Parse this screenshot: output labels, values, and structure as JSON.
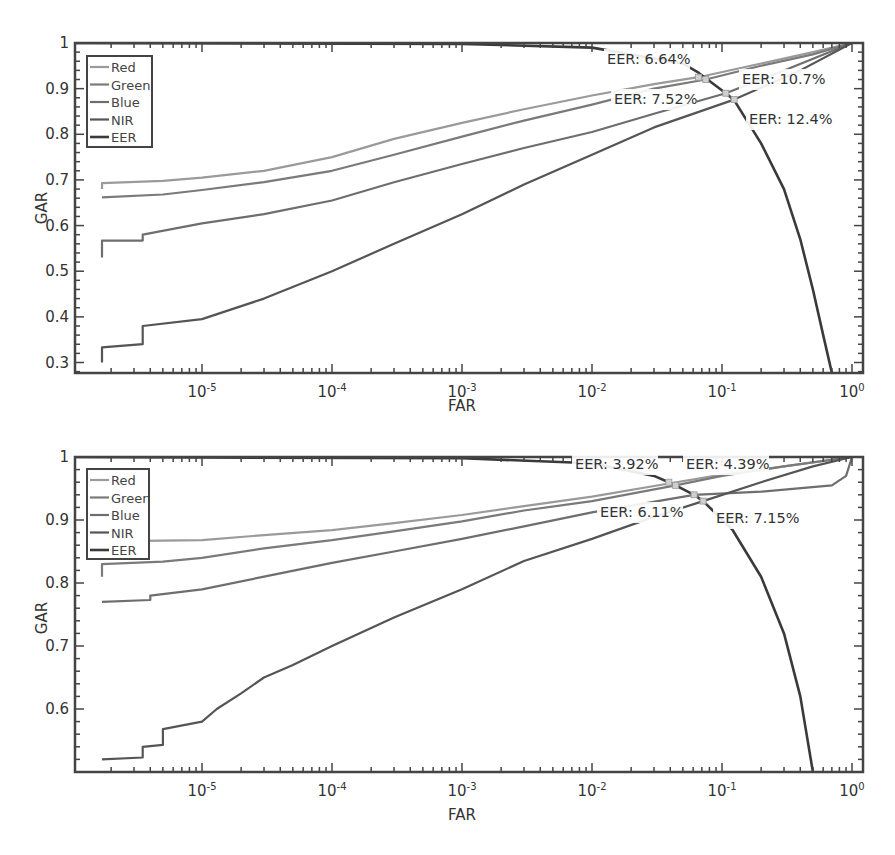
{
  "chart_data": [
    {
      "type": "line",
      "panel": "top",
      "title": "",
      "xlabel": "FAR",
      "ylabel": "GAR",
      "xscale": "log",
      "xlim": [
        1e-06,
        1
      ],
      "ylim": [
        0.277,
        1
      ],
      "xticks": [
        "10-5",
        "10-4",
        "10-3",
        "10-2",
        "10-1",
        "100"
      ],
      "xtick_values": [
        1e-05,
        0.0001,
        0.001,
        0.01,
        0.1,
        1
      ],
      "yticks": [
        0.3,
        0.4,
        0.5,
        0.6,
        0.7,
        0.8,
        0.9,
        1
      ],
      "ytick_labels": [
        "0.3",
        "0.4",
        "0.5",
        "0.6",
        "0.7",
        "0.8",
        "0.9",
        "1"
      ],
      "grid": false,
      "legend_position": "upper left",
      "legend": [
        "Red",
        "Green",
        "Blue",
        "NIR",
        "EER"
      ],
      "series": [
        {
          "name": "Red",
          "color": "#9a9a9a",
          "width": 2.2,
          "x": [
            1.7e-06,
            1.7e-06,
            5e-06,
            1e-05,
            3e-05,
            0.0001,
            0.0003,
            0.001,
            0.003,
            0.01,
            0.03,
            0.066,
            0.2,
            0.5,
            1
          ],
          "y": [
            0.68,
            0.693,
            0.698,
            0.705,
            0.72,
            0.75,
            0.79,
            0.825,
            0.855,
            0.885,
            0.91,
            0.925,
            0.955,
            0.98,
            1
          ]
        },
        {
          "name": "Green",
          "color": "#7a7a7a",
          "width": 2.2,
          "x": [
            1.7e-06,
            5e-06,
            1e-05,
            3e-05,
            0.0001,
            0.0003,
            0.001,
            0.003,
            0.01,
            0.03,
            0.075,
            0.2,
            0.5,
            1
          ],
          "y": [
            0.662,
            0.668,
            0.678,
            0.695,
            0.72,
            0.755,
            0.795,
            0.83,
            0.865,
            0.9,
            0.92,
            0.95,
            0.975,
            1
          ]
        },
        {
          "name": "Blue",
          "color": "#6e6e6e",
          "width": 2.2,
          "x": [
            1.7e-06,
            1.7e-06,
            3.5e-06,
            3.5e-06,
            1e-05,
            3e-05,
            0.0001,
            0.0003,
            0.001,
            0.003,
            0.01,
            0.03,
            0.107,
            0.3,
            1
          ],
          "y": [
            0.53,
            0.567,
            0.567,
            0.58,
            0.605,
            0.625,
            0.655,
            0.695,
            0.735,
            0.77,
            0.805,
            0.845,
            0.89,
            0.94,
            1
          ]
        },
        {
          "name": "NIR",
          "color": "#555555",
          "width": 2.2,
          "x": [
            1.7e-06,
            1.7e-06,
            3.5e-06,
            3.5e-06,
            1e-05,
            3e-05,
            0.0001,
            0.0003,
            0.001,
            0.003,
            0.01,
            0.03,
            0.124,
            0.4,
            1
          ],
          "y": [
            0.3,
            0.333,
            0.34,
            0.38,
            0.395,
            0.44,
            0.5,
            0.56,
            0.625,
            0.69,
            0.755,
            0.815,
            0.876,
            0.94,
            1
          ]
        },
        {
          "name": "EER",
          "color": "#3a3a3a",
          "width": 2.6,
          "x": [
            1e-06,
            0.001,
            0.01,
            0.05,
            0.066,
            0.107,
            0.124,
            0.2,
            0.3,
            0.4,
            0.5,
            0.6,
            0.7
          ],
          "y": [
            1.0,
            0.998,
            0.99,
            0.955,
            0.935,
            0.89,
            0.875,
            0.78,
            0.68,
            0.57,
            0.46,
            0.36,
            0.277
          ]
        }
      ],
      "annotations": [
        {
          "text": "EER: 6.64%",
          "x": 0.066,
          "y": 0.925,
          "label_px": [
            607,
            64
          ]
        },
        {
          "text": "EER: 7.52%",
          "x": 0.075,
          "y": 0.92,
          "label_px": [
            614,
            104
          ]
        },
        {
          "text": "EER: 10.7%",
          "x": 0.107,
          "y": 0.89,
          "label_px": [
            742,
            84
          ]
        },
        {
          "text": "EER: 12.4%",
          "x": 0.124,
          "y": 0.876,
          "label_px": [
            749,
            124
          ]
        }
      ]
    },
    {
      "type": "line",
      "panel": "bottom",
      "title": "",
      "xlabel": "FAR",
      "ylabel": "GAR",
      "xscale": "log",
      "xlim": [
        1e-06,
        1
      ],
      "ylim": [
        0.5,
        1
      ],
      "xticks": [
        "10-5",
        "10-4",
        "10-3",
        "10-2",
        "10-1",
        "100"
      ],
      "xtick_values": [
        1e-05,
        0.0001,
        0.001,
        0.01,
        0.1,
        1
      ],
      "yticks": [
        0.6,
        0.7,
        0.8,
        0.9,
        1
      ],
      "ytick_labels": [
        "0.6",
        "0.7",
        "0.8",
        "0.9",
        "1"
      ],
      "grid": false,
      "legend_position": "upper left",
      "legend": [
        "Red",
        "Green",
        "Blue",
        "NIR",
        "EER"
      ],
      "series": [
        {
          "name": "Red",
          "color": "#9a9a9a",
          "width": 2.2,
          "x": [
            1.7e-06,
            1e-05,
            3e-05,
            0.0001,
            0.0003,
            0.001,
            0.003,
            0.01,
            0.039,
            0.1,
            0.3,
            1
          ],
          "y": [
            0.866,
            0.868,
            0.876,
            0.884,
            0.895,
            0.908,
            0.922,
            0.937,
            0.958,
            0.972,
            0.985,
            1
          ]
        },
        {
          "name": "Green",
          "color": "#7a7a7a",
          "width": 2.2,
          "x": [
            1.7e-06,
            1.7e-06,
            5e-06,
            1e-05,
            3e-05,
            0.0001,
            0.0003,
            0.001,
            0.003,
            0.01,
            0.044,
            0.1,
            0.3,
            1
          ],
          "y": [
            0.81,
            0.83,
            0.834,
            0.84,
            0.855,
            0.868,
            0.882,
            0.898,
            0.915,
            0.93,
            0.955,
            0.97,
            0.985,
            1
          ]
        },
        {
          "name": "Blue",
          "color": "#6e6e6e",
          "width": 2.2,
          "x": [
            1.7e-06,
            4e-06,
            4e-06,
            1e-05,
            3e-05,
            0.0001,
            0.0003,
            0.001,
            0.003,
            0.01,
            0.061,
            0.2,
            0.7,
            0.9,
            1
          ],
          "y": [
            0.77,
            0.773,
            0.78,
            0.79,
            0.81,
            0.832,
            0.85,
            0.87,
            0.89,
            0.912,
            0.94,
            0.945,
            0.955,
            0.97,
            1
          ]
        },
        {
          "name": "NIR",
          "color": "#555555",
          "width": 2.2,
          "x": [
            1.7e-06,
            3.5e-06,
            3.5e-06,
            5e-06,
            5e-06,
            1e-05,
            1.3e-05,
            2e-05,
            3e-05,
            5e-05,
            0.0001,
            0.0003,
            0.001,
            0.003,
            0.01,
            0.03,
            0.0715,
            0.2,
            0.5,
            1
          ],
          "y": [
            0.52,
            0.523,
            0.54,
            0.543,
            0.568,
            0.58,
            0.6,
            0.625,
            0.65,
            0.67,
            0.7,
            0.745,
            0.79,
            0.835,
            0.87,
            0.905,
            0.93,
            0.96,
            0.985,
            1
          ]
        },
        {
          "name": "EER",
          "color": "#3a3a3a",
          "width": 2.6,
          "x": [
            1e-06,
            0.001,
            0.01,
            0.03,
            0.039,
            0.044,
            0.061,
            0.0715,
            0.12,
            0.2,
            0.3,
            0.4,
            0.5
          ],
          "y": [
            1.0,
            0.998,
            0.99,
            0.97,
            0.96,
            0.955,
            0.94,
            0.93,
            0.885,
            0.81,
            0.72,
            0.62,
            0.5
          ]
        }
      ],
      "annotations": [
        {
          "text": "EER: 3.92%",
          "x": 0.039,
          "y": 0.96,
          "label_px": [
            575,
            469
          ]
        },
        {
          "text": "EER: 4.39%",
          "x": 0.044,
          "y": 0.955,
          "label_px": [
            686,
            469
          ]
        },
        {
          "text": "EER: 6.11%",
          "x": 0.061,
          "y": 0.94,
          "label_px": [
            600,
            517
          ]
        },
        {
          "text": "EER: 7.15%",
          "x": 0.0715,
          "y": 0.93,
          "label_px": [
            716,
            523
          ]
        }
      ]
    }
  ],
  "panels": [
    {
      "name": "top",
      "left": 75,
      "top": 43,
      "right": 863,
      "bottom": 373,
      "x_decade_px": 130,
      "x_at_1": 852,
      "ylabel_px": [
        47,
        208
      ],
      "xlabel_px": [
        462,
        411
      ]
    },
    {
      "name": "bottom",
      "left": 75,
      "top": 457,
      "right": 863,
      "bottom": 772,
      "x_decade_px": 130,
      "x_at_1": 852,
      "ylabel_px": [
        47,
        618
      ],
      "xlabel_px": [
        462,
        820
      ]
    }
  ],
  "legend_box": {
    "top": {
      "x": 87,
      "y": 56,
      "w": 65,
      "h": 91
    },
    "bottom": {
      "x": 87,
      "y": 469,
      "w": 62,
      "h": 90
    }
  }
}
